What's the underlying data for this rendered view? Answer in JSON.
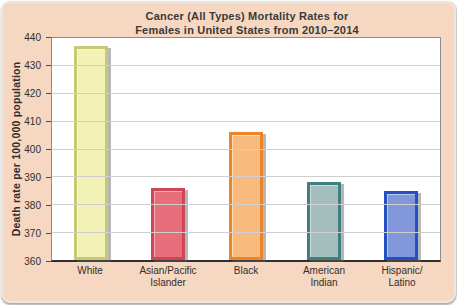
{
  "title_lines": [
    "Cancer (All Types) Mortality Rates for",
    "Females in United States from 2010–2014"
  ],
  "chart_data": {
    "type": "bar",
    "title": "Cancer (All Types) Mortality Rates for Females in United States from 2010–2014",
    "xlabel": "",
    "ylabel": "Death rate per 100,000 population",
    "ylim": [
      360,
      440
    ],
    "yticks": [
      440,
      430,
      420,
      410,
      400,
      390,
      380,
      370,
      360
    ],
    "grid": "horizontal",
    "legend": "none",
    "categories": [
      "White",
      "Asian/Pacific Islander",
      "Black",
      "American Indian",
      "Hispanic/Latino"
    ],
    "categories_display": [
      [
        "White"
      ],
      [
        "Asian/Pacific",
        "Islander"
      ],
      [
        "Black"
      ],
      [
        "American",
        "Indian"
      ],
      [
        "Hispanic/",
        "Latino"
      ]
    ],
    "values": [
      437,
      386,
      406,
      388,
      385
    ],
    "bar_colors": [
      {
        "fill": "#f2f1b6",
        "border": "#c9c873"
      },
      {
        "fill": "#e96e7b",
        "border": "#cf4558"
      },
      {
        "fill": "#f9ba7d",
        "border": "#ec8527"
      },
      {
        "fill": "#a5bebe",
        "border": "#3f7f7f"
      },
      {
        "fill": "#8297d9",
        "border": "#2351c4"
      }
    ]
  },
  "colors": {
    "card_background": "#f6d7c1",
    "plot_background": "#ffffff",
    "plot_border": "#8c8c8c",
    "axis_line": "#2f2f2f",
    "gridline": "#cfcfcf",
    "text": "#3a3a3a"
  }
}
